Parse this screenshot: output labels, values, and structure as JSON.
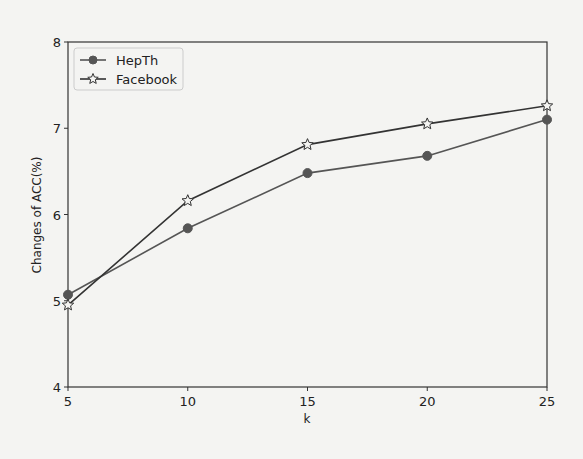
{
  "chart_data": {
    "type": "line",
    "title": "",
    "xlabel": "k",
    "ylabel": "Changes of ACC(%)",
    "x": [
      5,
      10,
      15,
      20,
      25
    ],
    "xticks": [
      5,
      10,
      15,
      20,
      25
    ],
    "yticks": [
      4,
      5,
      6,
      7,
      8
    ],
    "xlim": [
      5,
      25
    ],
    "ylim": [
      4,
      8
    ],
    "grid": false,
    "legend_position": "upper left",
    "series": [
      {
        "name": "HepTh",
        "marker": "circle",
        "color": "#555555",
        "values": [
          5.07,
          5.84,
          6.48,
          6.68,
          7.1
        ]
      },
      {
        "name": "Facebook",
        "marker": "star",
        "color": "#333333",
        "values": [
          4.95,
          6.16,
          6.81,
          7.05,
          7.26
        ]
      }
    ]
  }
}
